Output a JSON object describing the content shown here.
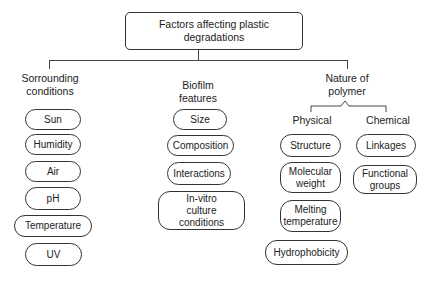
{
  "root": {
    "label": "Factors affecting plastic degradations"
  },
  "categories": [
    {
      "name": "Sorrounding conditions",
      "items": [
        "Sun",
        "Humidity",
        "Air",
        "pH",
        "Temperature",
        "UV"
      ]
    },
    {
      "name": "Biofilm features",
      "items": [
        "Size",
        "Composition",
        "Interactions",
        "In-vitro culture conditions"
      ]
    },
    {
      "name": "Nature of polymer",
      "subcategories": [
        {
          "name": "Physical",
          "items": [
            "Structure",
            "Molecular weight",
            "Melting temperature",
            "Hydrophobicity"
          ]
        },
        {
          "name": "Chemical",
          "items": [
            "Linkages",
            "Functional groups"
          ]
        }
      ]
    }
  ]
}
